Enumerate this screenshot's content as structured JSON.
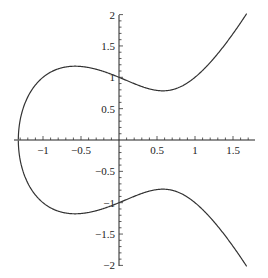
{
  "chart_data": {
    "type": "line",
    "title": "",
    "xlabel": "",
    "ylabel": "",
    "xlim": [
      -1.35,
      1.75
    ],
    "ylim": [
      -2.0,
      2.0
    ],
    "grid": false,
    "legend": null,
    "x_ticks": [
      -1,
      -0.5,
      0.5,
      1,
      1.5
    ],
    "x_tick_labels": [
      "−1",
      "−0.5",
      "0.5",
      "1",
      "1.5"
    ],
    "y_ticks": [
      -2,
      -1.5,
      -1,
      -0.5,
      0.5,
      1,
      1.5,
      2
    ],
    "y_tick_labels": [
      "−2",
      "−1.5",
      "−1",
      "−0.5",
      "0.5",
      "1",
      "1.5",
      "2"
    ],
    "series": [
      {
        "name": "upper branch",
        "x": [
          -1.3247,
          -1.3,
          -1.25,
          -1.2,
          -1.1,
          -1.0,
          -0.9,
          -0.8,
          -0.7,
          -0.577,
          -0.5,
          -0.4,
          -0.3,
          -0.2,
          -0.1,
          0.0,
          0.1,
          0.2,
          0.3,
          0.4,
          0.5,
          0.577,
          0.7,
          0.8,
          0.9,
          1.0,
          1.1,
          1.2,
          1.3,
          1.4,
          1.5,
          1.6,
          1.7
        ],
        "y": [
          0.0,
          0.262,
          0.515,
          0.66,
          0.84,
          1.0,
          1.016,
          1.095,
          1.148,
          1.174,
          1.173,
          1.158,
          1.131,
          1.091,
          1.049,
          1.0,
          0.95,
          0.903,
          0.862,
          0.83,
          0.791,
          0.786,
          0.829,
          0.832,
          0.866,
          1.0,
          1.024,
          1.184,
          1.346,
          1.557,
          1.768,
          2.01,
          2.261
        ]
      },
      {
        "name": "lower branch",
        "x": [
          -1.3247,
          -1.3,
          -1.25,
          -1.2,
          -1.1,
          -1.0,
          -0.9,
          -0.8,
          -0.7,
          -0.577,
          -0.5,
          -0.4,
          -0.3,
          -0.2,
          -0.1,
          0.0,
          0.1,
          0.2,
          0.3,
          0.4,
          0.5,
          0.577,
          0.7,
          0.8,
          0.9,
          1.0,
          1.1,
          1.2,
          1.3,
          1.4,
          1.5,
          1.6,
          1.7
        ],
        "y": [
          0.0,
          -0.262,
          -0.515,
          -0.66,
          -0.84,
          -1.0,
          -1.016,
          -1.095,
          -1.148,
          -1.174,
          -1.173,
          -1.158,
          -1.131,
          -1.091,
          -1.049,
          -1.0,
          -0.95,
          -0.903,
          -0.862,
          -0.83,
          -0.791,
          -0.786,
          -0.829,
          -0.832,
          -0.866,
          -1.0,
          -1.024,
          -1.184,
          -1.346,
          -1.557,
          -1.768,
          -2.01,
          -2.261
        ]
      }
    ],
    "equation": "y^2 = x^3 - x + 1",
    "x_range_plotted": [
      -1.3247,
      1.68
    ]
  },
  "layout": {
    "origin_px": [
      119,
      140
    ],
    "x_px_per_unit": 76,
    "y_px_per_unit": 62.7,
    "x_axis_px": [
      14,
      255
    ],
    "y_axis_px": [
      15,
      266
    ],
    "curve_color": "#333333",
    "axis_color": "#222222"
  }
}
